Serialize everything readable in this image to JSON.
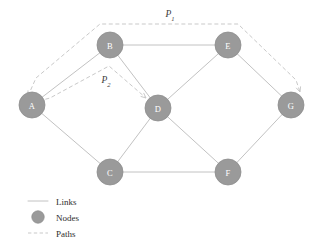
{
  "figure": {
    "background": "#ffffff",
    "node_color": "#9a9a9a",
    "node_stroke": "#8e8e8e",
    "link_color": "#c2c2c2",
    "path_color": "#c9c9c9",
    "label_color": "#ffffff",
    "text_color": "#2e2e2e"
  },
  "chart_data": {
    "type": "diagram",
    "title": "",
    "nodes": [
      {
        "id": "A",
        "label": "A",
        "x": 32,
        "y": 105
      },
      {
        "id": "B",
        "label": "B",
        "x": 110,
        "y": 45
      },
      {
        "id": "C",
        "label": "C",
        "x": 110,
        "y": 172
      },
      {
        "id": "D",
        "label": "D",
        "x": 158,
        "y": 108
      },
      {
        "id": "E",
        "label": "E",
        "x": 228,
        "y": 45
      },
      {
        "id": "F",
        "label": "F",
        "x": 228,
        "y": 172
      },
      {
        "id": "G",
        "label": "G",
        "x": 291,
        "y": 105
      }
    ],
    "node_radius": 13,
    "links": [
      {
        "source": "A",
        "target": "B"
      },
      {
        "source": "A",
        "target": "C"
      },
      {
        "source": "B",
        "target": "D"
      },
      {
        "source": "B",
        "target": "E"
      },
      {
        "source": "C",
        "target": "D"
      },
      {
        "source": "C",
        "target": "F"
      },
      {
        "source": "D",
        "target": "E"
      },
      {
        "source": "D",
        "target": "F"
      },
      {
        "source": "E",
        "target": "G"
      },
      {
        "source": "F",
        "target": "G"
      }
    ],
    "paths": [
      {
        "id": "P1",
        "label": "P",
        "subscript": "1",
        "label_x": 170,
        "label_y": 14,
        "route": "A-B-E-G",
        "style": "dashed",
        "arrows": [
          "A",
          "G"
        ],
        "points": "28,96 36,78 100,24 238,24 296,80 300,92"
      },
      {
        "id": "P2",
        "label": "P",
        "subscript": "2",
        "label_x": 106,
        "label_y": 80,
        "route": "A-B-D",
        "style": "dashed",
        "arrows": [
          "D"
        ],
        "points": "39,101 50,98 109,66 146,98"
      }
    ],
    "legend": {
      "position": "bottom-left",
      "items": [
        {
          "key": "links",
          "label": "Links",
          "symbol": "solid-line"
        },
        {
          "key": "nodes",
          "label": "Nodes",
          "symbol": "circle"
        },
        {
          "key": "paths",
          "label": "Paths",
          "symbol": "dashed-line"
        }
      ]
    }
  }
}
